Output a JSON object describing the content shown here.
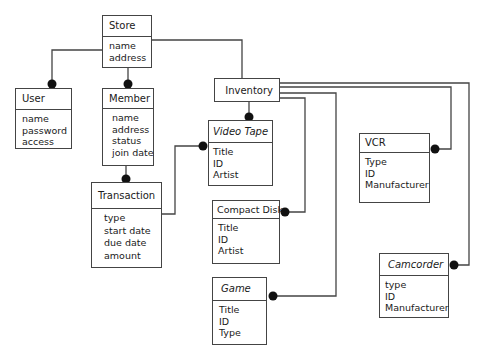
{
  "diagram": {
    "type": "class-diagram",
    "entities": [
      {
        "id": "store",
        "name": "Store",
        "attributes": [
          "name",
          "address"
        ]
      },
      {
        "id": "user",
        "name": "User",
        "attributes": [
          "name",
          "password",
          "access"
        ]
      },
      {
        "id": "member",
        "name": "Member",
        "attributes": [
          "name",
          "address",
          "status",
          "join date"
        ]
      },
      {
        "id": "transaction",
        "name": "Transaction",
        "attributes": [
          "type",
          "start date",
          "due date",
          "amount"
        ]
      },
      {
        "id": "inventory",
        "name": "Inventory",
        "attributes": []
      },
      {
        "id": "video_tape",
        "name": "Video Tape",
        "attributes": [
          "Title",
          "ID",
          "Artist"
        ]
      },
      {
        "id": "compact_disk",
        "name": "Compact Disk",
        "attributes": [
          "Title",
          "ID",
          "Artist"
        ]
      },
      {
        "id": "game",
        "name": "Game",
        "attributes": [
          "Title",
          "ID",
          "Type"
        ]
      },
      {
        "id": "vcr",
        "name": "VCR",
        "attributes": [
          "Type",
          "ID",
          "Manufacturer"
        ]
      },
      {
        "id": "camcorder",
        "name": "Camcorder",
        "attributes": [
          "type",
          "ID",
          "Manufacturer"
        ]
      }
    ],
    "relationships": [
      {
        "from": "Store",
        "to": "User",
        "end": "many"
      },
      {
        "from": "Store",
        "to": "Member",
        "end": "many"
      },
      {
        "from": "Store",
        "to": "Inventory",
        "end": "one"
      },
      {
        "from": "Member",
        "to": "Transaction",
        "end": "many"
      },
      {
        "from": "Transaction",
        "to": "Video Tape",
        "end": "many"
      },
      {
        "from": "Inventory",
        "to": "Video Tape",
        "end": "many"
      },
      {
        "from": "Inventory",
        "to": "Compact Disk",
        "end": "many"
      },
      {
        "from": "Inventory",
        "to": "Game",
        "end": "many"
      },
      {
        "from": "Inventory",
        "to": "VCR",
        "end": "many"
      },
      {
        "from": "Inventory",
        "to": "Camcorder",
        "end": "many"
      }
    ]
  },
  "colors": {
    "line": "#444444",
    "dot": "#111111",
    "background": "#ffffff"
  }
}
